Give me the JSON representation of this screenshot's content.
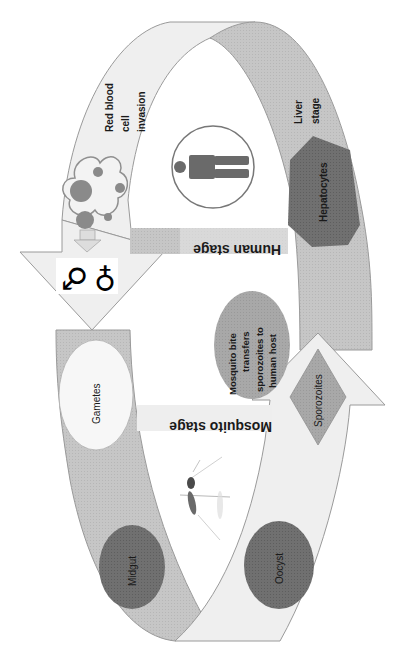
{
  "diagram": {
    "colors": {
      "light_band": "#efefef",
      "mid_band": "#c4c4c4",
      "dark_node": "#6e6e6e",
      "mid_node": "#a9a9a9",
      "light_node": "#f5f5f5",
      "outline": "#999999",
      "background": "#ffffff"
    },
    "stages": {
      "human": "Human stage",
      "mosquito": "Mosquito stage"
    },
    "labels": {
      "rbc_line1": "Red blood",
      "rbc_line2": "cell",
      "rbc_line3": "invasion",
      "liver_line1": "Liver",
      "liver_line2": "stage",
      "hepatocytes": "Hepatocytes",
      "bite_line1": "Mosquito bite",
      "bite_line2": "transfers",
      "bite_line3": "sporozoites to",
      "bite_line4": "human host",
      "sporozoites": "Sporozoites",
      "gametes": "Gametes",
      "midgut": "Midgut",
      "oocyst": "Oocyst"
    },
    "icons": {
      "male": "♂",
      "female": "♀"
    }
  }
}
